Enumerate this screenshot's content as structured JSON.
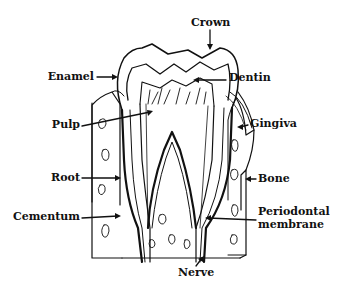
{
  "diagram": {
    "colors": {
      "ink": "#111111",
      "background": "#ffffff"
    },
    "labels": {
      "crown": "Crown",
      "enamel": "Enamel",
      "dentin": "Dentin",
      "pulp": "Pulp",
      "gingiva": "Gingiva",
      "root": "Root",
      "bone": "Bone",
      "cementum": "Cementum",
      "periodontal_line1": "Periodontal",
      "periodontal_line2": "membrane",
      "nerve": "Nerve"
    }
  }
}
